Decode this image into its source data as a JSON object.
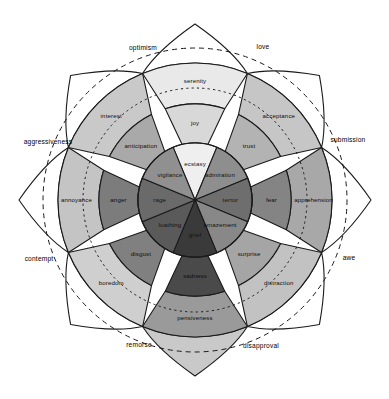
{
  "diagram": {
    "background_color": "#ffffff",
    "outline_color": "#1a1a1a",
    "canvas": {
      "width": 389,
      "height": 399,
      "cx": 195,
      "cy": 200
    },
    "rings": {
      "core_radius": 57,
      "mid_radius": 96,
      "outer_radius": 137,
      "tip_radius": 176,
      "dyad_ring_outer_radius": 152,
      "dyad_ring_inner_radius": 112,
      "dyad_ring_outer_style": "dashed",
      "dyad_ring_inner_style": "dotted"
    },
    "petals": [
      {
        "id": "joy",
        "angle_deg": -90,
        "inner": {
          "label": "ecstasy",
          "color": "#efefef"
        },
        "middle": {
          "label": "joy",
          "color": "#d8d8d8"
        },
        "outer": {
          "label": "serenity",
          "color": "#e9e9e9"
        },
        "tip_color": "#ffffff"
      },
      {
        "id": "trust",
        "angle_deg": -45,
        "inner": {
          "label": "admiration",
          "color": "#8e8e8e"
        },
        "middle": {
          "label": "trust",
          "color": "#b3b3b3"
        },
        "outer": {
          "label": "acceptance",
          "color": "#c6c6c6"
        },
        "tip_color": "#ffffff"
      },
      {
        "id": "fear",
        "angle_deg": 0,
        "inner": {
          "label": "terror",
          "color": "#6e6e6e"
        },
        "middle": {
          "label": "fear",
          "color": "#848484"
        },
        "outer": {
          "label": "apprehension",
          "color": "#a8a8a8"
        },
        "tip_color": "#ffffff"
      },
      {
        "id": "surprise",
        "angle_deg": 45,
        "inner": {
          "label": "amazement",
          "color": "#888888"
        },
        "middle": {
          "label": "surprise",
          "color": "#a5a5a5"
        },
        "outer": {
          "label": "distraction",
          "color": "#c2c2c2"
        },
        "tip_color": "#ffffff"
      },
      {
        "id": "sadness",
        "angle_deg": 90,
        "inner": {
          "label": "grief",
          "color": "#3a3a3a"
        },
        "middle": {
          "label": "sadness",
          "color": "#4a4a4a"
        },
        "outer": {
          "label": "pensiveness",
          "color": "#9a9a9a"
        },
        "tip_color": "#c9c9c9"
      },
      {
        "id": "disgust",
        "angle_deg": 135,
        "inner": {
          "label": "loathing",
          "color": "#5a5a5a"
        },
        "middle": {
          "label": "disgust",
          "color": "#808080"
        },
        "outer": {
          "label": "boredom",
          "color": "#cfcfcf"
        },
        "tip_color": "#ffffff"
      },
      {
        "id": "anger",
        "angle_deg": 180,
        "inner": {
          "label": "rage",
          "color": "#6a6a6a"
        },
        "middle": {
          "label": "anger",
          "color": "#7c7c7c"
        },
        "outer": {
          "label": "annoyance",
          "color": "#c4c4c4"
        },
        "tip_color": "#ffffff"
      },
      {
        "id": "anticipation",
        "angle_deg": -135,
        "inner": {
          "label": "vigilance",
          "color": "#909090"
        },
        "middle": {
          "label": "anticipation",
          "color": "#a9a9a9"
        },
        "outer": {
          "label": "interest",
          "color": "#c9c9c9"
        },
        "tip_color": "#ffffff"
      }
    ],
    "dyads": [
      {
        "id": "optimism",
        "label": "optimism",
        "angle_deg": -112.5,
        "x": 143,
        "y": 48
      },
      {
        "id": "love",
        "label": "love",
        "angle_deg": -67.5,
        "x": 263,
        "y": 47
      },
      {
        "id": "submission",
        "label": "submission",
        "angle_deg": -22.5,
        "x": 348,
        "y": 140
      },
      {
        "id": "awe",
        "label": "awe",
        "angle_deg": 22.5,
        "x": 349,
        "y": 258
      },
      {
        "id": "disapproval",
        "label": "disapproval",
        "angle_deg": 67.5,
        "x": 261,
        "y": 346
      },
      {
        "id": "remorse",
        "label": "remorse",
        "angle_deg": 112.5,
        "x": 139,
        "y": 345
      },
      {
        "id": "contempt",
        "label": "contempt",
        "angle_deg": 157.5,
        "x": 39,
        "y": 259
      },
      {
        "id": "aggressiveness",
        "label": "aggressiveness",
        "angle_deg": 202.5,
        "x": 48,
        "y": 142
      }
    ]
  },
  "chart_data": {
    "type": "pie",
    "subtitle": "",
    "xlabel": "",
    "ylabel": "",
    "legend_position": "none",
    "grid": false,
    "sectors": 8,
    "intensity_levels": [
      "inner (most intense)",
      "middle (basic)",
      "outer (least intense)"
    ],
    "categories": [
      "joy",
      "trust",
      "fear",
      "surprise",
      "sadness",
      "disgust",
      "anger",
      "anticipation"
    ],
    "series": [
      {
        "name": "inner (most intense)",
        "values": [
          "ecstasy",
          "admiration",
          "terror",
          "amazement",
          "grief",
          "loathing",
          "rage",
          "vigilance"
        ]
      },
      {
        "name": "middle (basic emotion)",
        "values": [
          "joy",
          "trust",
          "fear",
          "surprise",
          "sadness",
          "disgust",
          "anger",
          "anticipation"
        ]
      },
      {
        "name": "outer (least intense)",
        "values": [
          "serenity",
          "acceptance",
          "apprehension",
          "distraction",
          "pensiveness",
          "boredom",
          "annoyance",
          "interest"
        ]
      }
    ],
    "annotations": [
      "optimism",
      "love",
      "submission",
      "awe",
      "disapproval",
      "remorse",
      "contempt",
      "aggressiveness"
    ],
    "annotation_note": "Dyads formed between adjacent primary emotions, printed outside the dashed rings"
  }
}
